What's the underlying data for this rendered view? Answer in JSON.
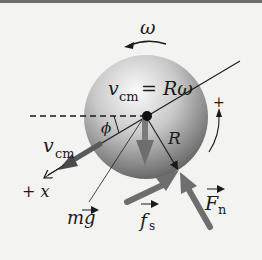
{
  "diagram": {
    "labels": {
      "omega": "ω",
      "vcm_eq_main": "v",
      "vcm_eq_sub": "cm",
      "vcm_eq_rhs": " = Rω",
      "phi": "ϕ",
      "R": "R",
      "plus": "+",
      "vcm_main": "v",
      "vcm_sub": "cm",
      "plus_x": "+ x",
      "mg": "mg",
      "fs_main": "f",
      "fs_sub": "s",
      "Fn_main": "F",
      "Fn_sub": "n"
    },
    "colors": {
      "background": "#f3f3f1",
      "sphere_light": "#fbfbfb",
      "sphere_dark": "#5a5a5a",
      "force_arrow": "#6e6e6e",
      "line": "#1a1a1a"
    }
  }
}
